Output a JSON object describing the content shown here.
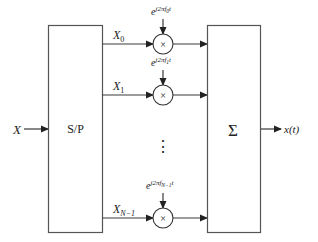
{
  "diagram": {
    "input": {
      "label": "X"
    },
    "serial_to_parallel": {
      "label": "S/P"
    },
    "branches": [
      {
        "symbol_base": "X",
        "symbol_sub": "0",
        "exp_base": "e",
        "exp_sup": "j2πf",
        "exp_sup_sub": "0",
        "exp_sup_tail": "t",
        "multiplier": "×"
      },
      {
        "symbol_base": "X",
        "symbol_sub": "1",
        "exp_base": "e",
        "exp_sup": "j2πf",
        "exp_sup_sub": "1",
        "exp_sup_tail": "t",
        "multiplier": "×"
      },
      {
        "symbol_base": "X",
        "symbol_sub": "N−1",
        "exp_base": "e",
        "exp_sup": "j2πf",
        "exp_sup_sub": "N−1",
        "exp_sup_tail": "t",
        "multiplier": "×"
      }
    ],
    "ellipsis": "⋮",
    "summation": {
      "label": "Σ"
    },
    "output": {
      "label": "x(t)"
    }
  }
}
